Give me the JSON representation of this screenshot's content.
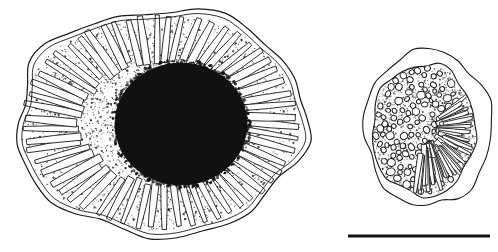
{
  "figure": {
    "kind": "scientific-line-drawing",
    "background_color": "#ffffff",
    "ink_color": "#1a1a1a",
    "caption": "",
    "panel_count": 2
  },
  "panels": [
    {
      "id": "panel-left",
      "name": "left-specimen",
      "description": "Large ovoid cross-section with wavy outer wall, dense radial palisade of elongated lobes, stippled cytoplasm and a large solid black central mass",
      "center": {
        "x": 160,
        "y": 122
      },
      "outer_radius_x": 146,
      "outer_radius_y": 113,
      "core": {
        "name": "central-dark-mass",
        "center": {
          "x": 181,
          "y": 124
        },
        "radius_x": 66,
        "radius_y": 61,
        "fill_color": "#111111"
      },
      "palisade": {
        "name": "radial-lobe-ring",
        "lobe_count": 58,
        "inner_fraction": 0.54,
        "outer_fraction": 0.94
      },
      "stipple": {
        "name": "cytoplasm-stipple",
        "dot_count": 2100,
        "color": "#222222"
      }
    },
    {
      "id": "panel-right",
      "name": "right-specimen",
      "description": "Smaller rounded cross-section with thin outer envelope, inner body filled with small oval vesicles on the left and elongated rod-shaped bodies on the right, set in a stippled matrix",
      "center": {
        "x": 428,
        "y": 128
      },
      "outer_radius_x": 64,
      "outer_radius_y": 78,
      "inner_body": {
        "name": "inner-body",
        "center": {
          "x": 424,
          "y": 130
        },
        "radius_x": 52,
        "radius_y": 66
      },
      "vesicles": {
        "name": "oval-vesicle-field",
        "count": 120,
        "color": "#1a1a1a"
      },
      "rods": {
        "name": "rod-body-field",
        "count": 46,
        "color": "#1a1a1a"
      },
      "stipple": {
        "name": "matrix-stipple",
        "dot_count": 1400,
        "color": "#222222"
      }
    }
  ],
  "scale_bar": {
    "name": "scale-bar",
    "label": "",
    "x_start": 348,
    "x_end": 490,
    "y": 236,
    "thickness": 3,
    "color": "#111111"
  }
}
